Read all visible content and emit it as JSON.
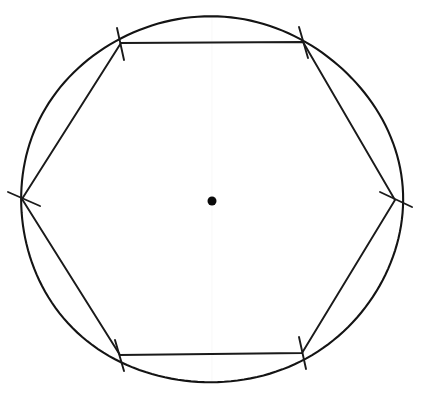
{
  "figure": {
    "background_color": "#ffffff",
    "ink_color": "#1a1a1a",
    "center_dot_color": "#0a0a0a",
    "construction_line_color": "#fbfbfb"
  },
  "chart_data": {
    "type": "diagram",
    "width": 425,
    "height": 402,
    "circle": {
      "label": "circumscribed circle",
      "center_x": 211,
      "center_y": 200,
      "radius_x": 191,
      "radius_y": 183,
      "stroke_width": 2.1,
      "color": "#141414"
    },
    "center_point": {
      "label": "center",
      "x": 212,
      "y": 201,
      "diameter": 9,
      "color": "#0a0a0a"
    },
    "construction_line": {
      "label": "faint vertical construction line",
      "x": 212,
      "y1": 18,
      "y2": 384,
      "color": "#fbfbfb"
    },
    "hexagon": {
      "label": "inscribed regular hexagon",
      "sides": 6,
      "stroke_width": 1.9,
      "color": "#1a1a1a",
      "vertices": [
        {
          "name": "top-left",
          "x": 121,
          "y": 43
        },
        {
          "name": "top-right",
          "x": 303,
          "y": 42
        },
        {
          "name": "right",
          "x": 395,
          "y": 200
        },
        {
          "name": "bottom-right",
          "x": 302,
          "y": 353
        },
        {
          "name": "bottom-left",
          "x": 120,
          "y": 355
        },
        {
          "name": "left",
          "x": 22,
          "y": 199
        }
      ],
      "edges": [
        {
          "name": "top",
          "from": "top-left",
          "to": "top-right"
        },
        {
          "name": "upper-right",
          "from": "top-right",
          "to": "right"
        },
        {
          "name": "lower-right",
          "from": "right",
          "to": "bottom-right"
        },
        {
          "name": "bottom",
          "from": "bottom-right",
          "to": "bottom-left"
        },
        {
          "name": "lower-left",
          "from": "bottom-left",
          "to": "left"
        },
        {
          "name": "upper-left",
          "from": "left",
          "to": "top-left"
        }
      ]
    },
    "tick_marks": [
      {
        "name": "tick-top-left",
        "x": 121,
        "y": 43,
        "x1": 117,
        "y1": 28,
        "x2": 124,
        "y2": 60
      },
      {
        "name": "tick-top-right",
        "x": 303,
        "y": 42,
        "x1": 299,
        "y1": 27,
        "x2": 308,
        "y2": 58
      },
      {
        "name": "tick-right",
        "x": 395,
        "y": 200,
        "x1": 380,
        "y1": 192,
        "x2": 412,
        "y2": 207
      },
      {
        "name": "tick-bottom-right",
        "x": 302,
        "y": 353,
        "x1": 299,
        "y1": 337,
        "x2": 306,
        "y2": 369
      },
      {
        "name": "tick-bottom-left",
        "x": 120,
        "y": 355,
        "x1": 115,
        "y1": 340,
        "x2": 124,
        "y2": 371
      },
      {
        "name": "tick-left",
        "x": 22,
        "y": 199,
        "x1": 8,
        "y1": 192,
        "x2": 40,
        "y2": 206
      }
    ]
  }
}
